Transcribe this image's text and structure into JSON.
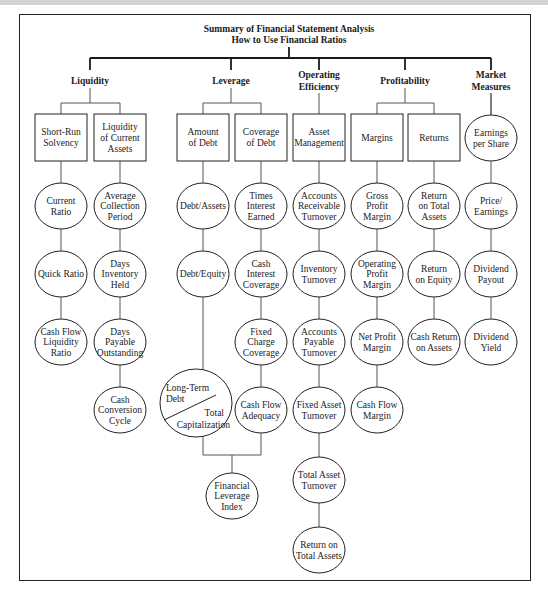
{
  "title": {
    "line1": "Summary of Financial Statement Analysis",
    "line2": "How to Use Financial Ratios"
  },
  "categories": [
    {
      "id": "liquidity",
      "label": [
        "Liquidity"
      ],
      "x": 90
    },
    {
      "id": "leverage",
      "label": [
        "Leverage"
      ],
      "x": 231
    },
    {
      "id": "operating-efficiency",
      "label": [
        "Operating",
        "Efficiency"
      ],
      "x": 319
    },
    {
      "id": "profitability",
      "label": [
        "Profitability"
      ],
      "x": 405
    },
    {
      "id": "market-measures",
      "label": [
        "Market",
        "Measures"
      ],
      "x": 491
    }
  ],
  "boxes": [
    {
      "id": "short-run-solvency",
      "category": "liquidity",
      "label": [
        "Short-Run",
        "Solvency"
      ],
      "x": 61
    },
    {
      "id": "liquidity-of-current-assets",
      "category": "liquidity",
      "label": [
        "Liquidity",
        "of Current",
        "Assets"
      ],
      "x": 120
    },
    {
      "id": "amount-of-debt",
      "category": "leverage",
      "label": [
        "Amount",
        "of Debt"
      ],
      "x": 203
    },
    {
      "id": "coverage-of-debt",
      "category": "leverage",
      "label": [
        "Coverage",
        "of Debt"
      ],
      "x": 261
    },
    {
      "id": "asset-management",
      "category": "operating-efficiency",
      "label": [
        "Asset",
        "Management"
      ],
      "x": 319
    },
    {
      "id": "margins",
      "category": "profitability",
      "label": [
        "Margins"
      ],
      "x": 377
    },
    {
      "id": "returns",
      "category": "profitability",
      "label": [
        "Returns"
      ],
      "x": 434
    }
  ],
  "columns": [
    {
      "parent": "short-run-solvency",
      "x": 61,
      "ratios": [
        [
          "Current",
          "Ratio"
        ],
        [
          "Quick Ratio"
        ],
        [
          "Cash Flow",
          "Liquidity",
          "Ratio"
        ]
      ]
    },
    {
      "parent": "liquidity-of-current-assets",
      "x": 120,
      "ratios": [
        [
          "Average",
          "Collection",
          "Period"
        ],
        [
          "Days",
          "Inventory",
          "Held"
        ],
        [
          "Days",
          "Payable",
          "Outstanding"
        ],
        [
          "Cash",
          "Conversion",
          "Cycle"
        ]
      ]
    },
    {
      "parent": "amount-of-debt",
      "x": 203,
      "ratios": [
        [
          "Debt/Assets"
        ],
        [
          "Debt/Equity"
        ]
      ]
    },
    {
      "parent": "coverage-of-debt",
      "x": 261,
      "ratios": [
        [
          "Times",
          "Interest",
          "Earned"
        ],
        [
          "Cash",
          "Interest",
          "Coverage"
        ],
        [
          "Fixed",
          "Charge",
          "Coverage"
        ],
        [
          "Cash Flow",
          "Adequacy"
        ]
      ]
    },
    {
      "parent": "asset-management",
      "x": 319,
      "ratios": [
        [
          "Accounts",
          "Receivable",
          "Turnover"
        ],
        [
          "Inventory",
          "Turnover"
        ],
        [
          "Accounts",
          "Payable",
          "Turnover"
        ],
        [
          "Fixed Asset",
          "Turnover"
        ],
        [
          "Total Asset",
          "Turnover"
        ],
        [
          "Return on",
          "Total Assets"
        ]
      ]
    },
    {
      "parent": "margins",
      "x": 377,
      "ratios": [
        [
          "Gross",
          "Profit",
          "Margin"
        ],
        [
          "Operating",
          "Profit",
          "Margin"
        ],
        [
          "Net Profit",
          "Margin"
        ],
        [
          "Cash Flow",
          "Margin"
        ]
      ]
    },
    {
      "parent": "returns",
      "x": 434,
      "ratios": [
        [
          "Return",
          "on Total",
          "Assets"
        ],
        [
          "Return",
          "on Equity"
        ],
        [
          "Cash Return",
          "on Assets"
        ]
      ]
    },
    {
      "parent": "market-measures",
      "x": 491,
      "ratios": [
        [
          "Earnings",
          "per Share"
        ],
        [
          "Price/",
          "Earnings"
        ],
        [
          "Dividend",
          "Payout"
        ],
        [
          "Dividend",
          "Yield"
        ]
      ]
    }
  ],
  "special": {
    "long_term_debt_ratio": {
      "numerator": "Long-Term Debt",
      "numerator_lines": [
        "Long-Term",
        "Debt"
      ],
      "denominator": "Total Capitalization",
      "denominator_lines": [
        "Total",
        "Capitalization"
      ]
    },
    "financial_leverage_index": [
      "Financial",
      "Leverage",
      "Index"
    ]
  }
}
